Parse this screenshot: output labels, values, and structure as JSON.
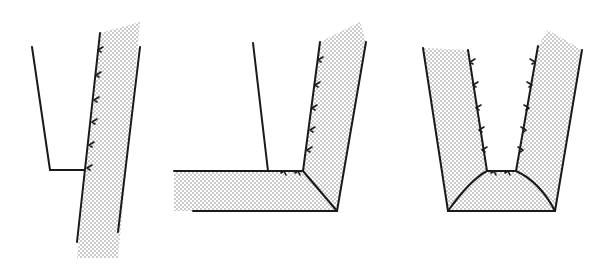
{
  "diagram": {
    "colors": {
      "line": "#1a1a1a",
      "stipple": "#8a8a8a",
      "background": "#ffffff"
    },
    "figures": [
      {
        "id": "fig-1",
        "name": "single-inclined-wall-with-step",
        "fill_polygon": "100,33 140,22 118,258 77,258",
        "lines": [
          [
            32,
            47,
            50,
            170
          ],
          [
            50,
            170,
            84,
            170
          ],
          [
            100,
            33,
            77,
            242
          ],
          [
            140,
            47,
            118,
            232
          ]
        ],
        "ticks": [
          [
            98,
            50
          ],
          [
            96,
            75
          ],
          [
            94,
            100
          ],
          [
            92,
            122
          ],
          [
            89,
            145
          ],
          [
            87,
            168
          ]
        ]
      },
      {
        "id": "fig-2",
        "name": "wall-with-horizontal-slab-corner",
        "fill_polygon": "174,171 303,171 320,42 360,22 366,42 337,211 174,211",
        "lines": [
          [
            253,
            43,
            268,
            171
          ],
          [
            174,
            171,
            303,
            171
          ],
          [
            193,
            211,
            337,
            211
          ],
          [
            303,
            171,
            320,
            42
          ],
          [
            366,
            42,
            337,
            211
          ],
          [
            303,
            171,
            337,
            211
          ]
        ],
        "ticks": [
          [
            318,
            60
          ],
          [
            315,
            85
          ],
          [
            312,
            108
          ],
          [
            310,
            130
          ],
          [
            307,
            150
          ],
          [
            284,
            171
          ],
          [
            298,
            171
          ]
        ]
      },
      {
        "id": "fig-3",
        "name": "symmetric-u-channel-with-curved-base",
        "fill_polygon": "423,48 468,50 487,171 516,171 538,46 548,30 582,50 555,211 448,211",
        "lines": [
          [
            423,
            48,
            448,
            211
          ],
          [
            468,
            50,
            487,
            171
          ],
          [
            487,
            171,
            516,
            171
          ],
          [
            516,
            171,
            538,
            46
          ],
          [
            582,
            50,
            555,
            211
          ],
          [
            448,
            211,
            555,
            211
          ]
        ],
        "curve": "M448,211 Q470,180 487,171 M516,171 Q540,182 555,211",
        "ticks_left": [
          [
            470,
            62
          ],
          [
            473,
            85
          ],
          [
            476,
            108
          ],
          [
            479,
            130
          ],
          [
            482,
            150
          ]
        ],
        "ticks_right": [
          [
            535,
            62
          ],
          [
            532,
            85
          ],
          [
            529,
            108
          ],
          [
            526,
            130
          ],
          [
            523,
            150
          ]
        ],
        "ticks_bottom": [
          [
            494,
            171
          ],
          [
            508,
            171
          ]
        ]
      }
    ]
  }
}
